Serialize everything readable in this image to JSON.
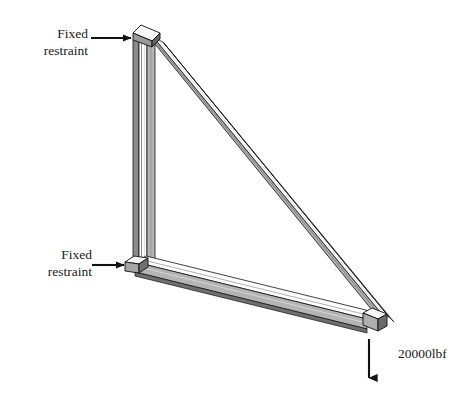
{
  "figure": {
    "type": "engineering-diagram",
    "background_color": "#ffffff",
    "line_color": "#000000",
    "member_fill_light": "#ffffff",
    "member_fill_mid": "#b8b8b8",
    "member_fill_dark": "#7a7a7a",
    "member_fill_shadow": "#4d4d4d"
  },
  "annotations": {
    "fixed_restraint_top": {
      "line1": "Fixed",
      "line2": "restraint",
      "icon": "arrow-right-icon"
    },
    "fixed_restraint_bottom": {
      "line1": "Fixed",
      "line2": "restraint",
      "icon": "arrow-right-icon"
    },
    "load": {
      "text": "20000lbf",
      "icon": "arrow-down-icon",
      "direction": "down"
    }
  },
  "geometry": {
    "top_joint": {
      "x": 142,
      "y": 34
    },
    "bottom_left_joint": {
      "x": 135,
      "y": 266
    },
    "bottom_right_joint": {
      "x": 372,
      "y": 323
    },
    "members": [
      {
        "name": "vertical-column",
        "from": "top_joint",
        "to": "bottom_left_joint"
      },
      {
        "name": "bottom-chord",
        "from": "bottom_left_joint",
        "to": "bottom_right_joint"
      },
      {
        "name": "diagonal-brace",
        "from": "top_joint",
        "to": "bottom_right_joint"
      }
    ]
  }
}
